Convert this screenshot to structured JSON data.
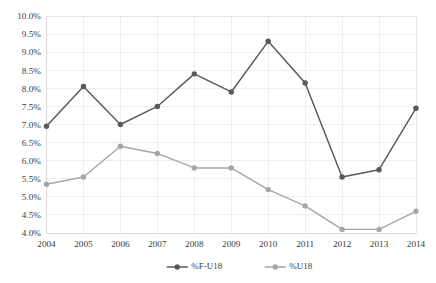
{
  "chart_data": {
    "type": "line",
    "title": "",
    "xlabel": "",
    "ylabel": "",
    "categories": [
      "2004",
      "2005",
      "2006",
      "2007",
      "2008",
      "2009",
      "2010",
      "2011",
      "2012",
      "2013",
      "2014"
    ],
    "series": [
      {
        "name": "%F-U18",
        "color": "#595959",
        "marker": "circle",
        "values": [
          6.95,
          8.05,
          7.0,
          7.5,
          8.4,
          7.9,
          9.3,
          8.15,
          5.55,
          5.75,
          7.45
        ]
      },
      {
        "name": "%U18",
        "color": "#a6a6a6",
        "marker": "circle",
        "values": [
          5.35,
          5.55,
          6.4,
          6.2,
          5.8,
          5.8,
          5.2,
          4.75,
          4.1,
          4.1,
          4.6
        ]
      }
    ],
    "ylim": [
      4.0,
      10.0
    ],
    "ytick_step": 0.5,
    "ytick_labels": [
      "10.0%",
      "9.5%",
      "9.0%",
      "8.5%",
      "8.0%",
      "7.5%",
      "7.0%",
      "6.5%",
      "6.0%",
      "5.5%",
      "5.0%",
      "4.5%",
      "4.0%"
    ],
    "ytick_values": [
      10.0,
      9.5,
      9.0,
      8.5,
      8.0,
      7.5,
      7.0,
      6.5,
      6.0,
      5.5,
      5.0,
      4.5,
      4.0
    ],
    "xtick_labels": [
      "2004",
      "2005",
      "2006",
      "2007",
      "2008",
      "2009",
      "2010",
      "2011",
      "2012",
      "2013",
      "2014"
    ],
    "grid": true,
    "grid_color": "#e9e9ef",
    "legend_position": "bottom",
    "legend": [
      {
        "label": "%F-U18",
        "color": "#595959"
      },
      {
        "label": "%U18",
        "color": "#a6a6a6"
      }
    ],
    "background": "#ffffff"
  },
  "axes": {
    "y_ticks": [
      {
        "label": "10.0%",
        "value": 10.0
      },
      {
        "label": "9.5%",
        "value": 9.5
      },
      {
        "label": "9.0%",
        "value": 9.0
      },
      {
        "label": "8.5%",
        "value": 8.5
      },
      {
        "label": "8.0%",
        "value": 8.0
      },
      {
        "label": "7.5%",
        "value": 7.5
      },
      {
        "label": "7.0%",
        "value": 7.0
      },
      {
        "label": "6.5%",
        "value": 6.5
      },
      {
        "label": "6.0%",
        "value": 6.0
      },
      {
        "label": "5.5%",
        "value": 5.5
      },
      {
        "label": "5.0%",
        "value": 5.0
      },
      {
        "label": "4.5%",
        "value": 4.5
      },
      {
        "label": "4.0%",
        "value": 4.0
      }
    ],
    "x_ticks": [
      {
        "label": "2004"
      },
      {
        "label": "2005"
      },
      {
        "label": "2006"
      },
      {
        "label": "2007"
      },
      {
        "label": "2008"
      },
      {
        "label": "2009"
      },
      {
        "label": "2010"
      },
      {
        "label": "2011"
      },
      {
        "label": "2012"
      },
      {
        "label": "2013"
      },
      {
        "label": "2014"
      }
    ]
  }
}
